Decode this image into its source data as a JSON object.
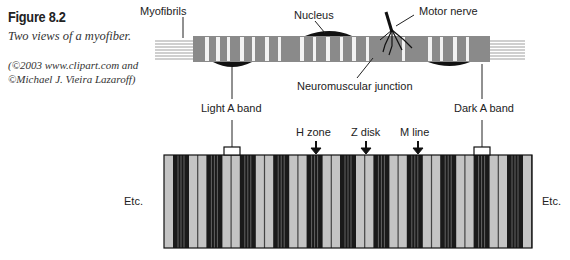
{
  "caption": {
    "title": "Figure 8.2",
    "subtitle": "Two views of a myofiber.",
    "credit_line1": "(©2003 www.clipart.com and",
    "credit_line2": "©Michael J. Vieira Lazaroff)"
  },
  "top_view": {
    "labels": {
      "myofibrils": "Myofibrils",
      "nucleus": "Nucleus",
      "motor_nerve": "Motor nerve",
      "neuromuscular_junction": "Neuromuscular junction",
      "light_a_band": "Light A band",
      "dark_a_band": "Dark A band"
    }
  },
  "bottom_view": {
    "labels": {
      "h_zone": "H zone",
      "z_disk": "Z disk",
      "m_line": "M line",
      "etc_left": "Etc.",
      "etc_right": "Etc."
    },
    "colors": {
      "dark_band": "#1a1a1a",
      "light_band": "#c4c4c4",
      "line": "#444444"
    }
  }
}
